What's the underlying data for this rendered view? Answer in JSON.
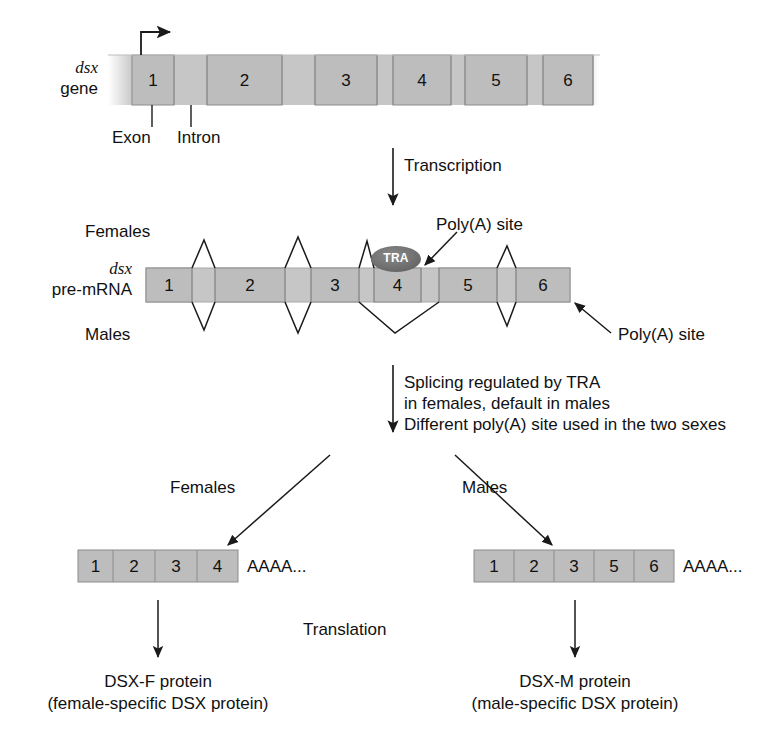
{
  "figure": {
    "colors": {
      "exon_fill": "#b9b9b9",
      "intron_fill": "#c9c9c9",
      "bar_stroke": "#8c8c8c",
      "tra_fill": "#6e6e6e",
      "line": "#1a1a1a",
      "text": "#111111"
    }
  },
  "gene": {
    "label_italic": "dsx",
    "label_plain": "gene",
    "exons": [
      "1",
      "2",
      "3",
      "4",
      "5",
      "6"
    ],
    "annotations": {
      "exon_label": "Exon",
      "intron_label": "Intron"
    }
  },
  "transcription": {
    "label": "Transcription"
  },
  "premrna": {
    "label_italic": "dsx",
    "label_plain": "pre-mRNA",
    "exons": [
      "1",
      "2",
      "3",
      "4",
      "5",
      "6"
    ],
    "females_label": "Females",
    "males_label": "Males",
    "tra_label": "TRA",
    "polya_site_female": "Poly(A) site",
    "polya_site_male": "Poly(A) site"
  },
  "splicing_step": {
    "line1": "Splicing regulated by TRA",
    "line2": "in females, default in males",
    "line3": "Different poly(A) site used in the two sexes"
  },
  "branches": {
    "female_label": "Females",
    "male_label": "Males"
  },
  "female_mrna": {
    "exons": [
      "1",
      "2",
      "3",
      "4"
    ],
    "tail": "AAAA..."
  },
  "male_mrna": {
    "exons": [
      "1",
      "2",
      "3",
      "5",
      "6"
    ],
    "tail": "AAAA..."
  },
  "translation": {
    "label": "Translation"
  },
  "female_protein": {
    "line1": "DSX-F protein",
    "line2": "(female-specific DSX protein)"
  },
  "male_protein": {
    "line1": "DSX-M protein",
    "line2": "(male-specific DSX protein)"
  }
}
